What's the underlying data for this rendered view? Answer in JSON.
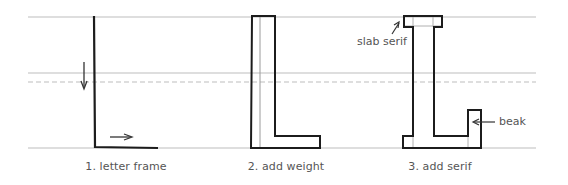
{
  "figure": {
    "colors": {
      "guide": "#bdbdbd",
      "stroke": "#1c1c1c",
      "inner": "#9a9a9a",
      "text": "#555555"
    },
    "guidelines": [
      {
        "name": "cap-line",
        "y": 17,
        "style": "solid"
      },
      {
        "name": "mid-line",
        "y": 73,
        "style": "solid"
      },
      {
        "name": "x-height-line",
        "y": 82,
        "style": "dashed"
      },
      {
        "name": "baseline",
        "y": 148,
        "style": "solid"
      }
    ],
    "steps": [
      {
        "number": 1,
        "caption": "1. letter frame"
      },
      {
        "number": 2,
        "caption": "2. add weight"
      },
      {
        "number": 3,
        "caption": "3. add serif"
      }
    ],
    "annotations": {
      "slab_serif": "slab serif",
      "beak": "beak"
    }
  }
}
